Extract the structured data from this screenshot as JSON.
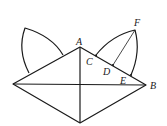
{
  "diagram": {
    "type": "geometry",
    "stroke_color": "#1a1a1a",
    "points": {
      "A": {
        "label": "A",
        "x": 80,
        "y": 47
      },
      "B": {
        "label": "B",
        "x": 146,
        "y": 85
      },
      "C": {
        "label": "C",
        "x": 96,
        "y": 56
      },
      "D": {
        "label": "D",
        "x": 113,
        "y": 65
      },
      "E": {
        "label": "E",
        "x": 131,
        "y": 75
      },
      "F": {
        "label": "F",
        "x": 135,
        "y": 30
      }
    },
    "labels": {
      "A": "A",
      "B": "B",
      "C": "C",
      "D": "D",
      "E": "E",
      "F": "F"
    }
  }
}
